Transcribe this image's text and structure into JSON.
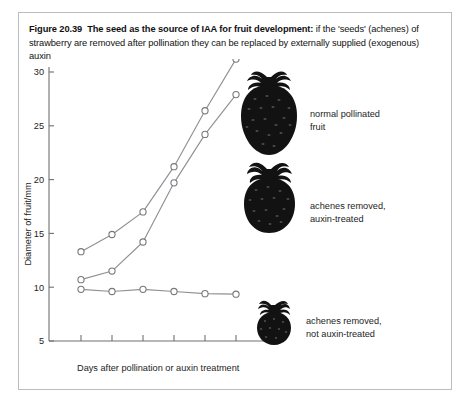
{
  "figure": {
    "number": "Figure 20.39",
    "title_bold": "The seed as the source of IAA for fruit development:",
    "title_rest": " if the 'seeds' (achenes) of strawberry are removed after pollination they can be replaced by externally supplied (exogenous) auxin"
  },
  "chart_data": {
    "type": "line",
    "title": "",
    "xlabel": "Days after pollination or auxin treatment",
    "ylabel": "Diameter of fruit/mm",
    "ylim": [
      5,
      30
    ],
    "yticks": [
      5,
      10,
      15,
      20,
      25,
      30
    ],
    "ytick_labels": [
      "5",
      "10",
      "15",
      "20",
      "25",
      "30"
    ],
    "xticks": [
      1,
      2,
      3,
      4,
      5,
      6
    ],
    "xtick_labels": [
      "",
      "",
      "",
      "",
      "",
      ""
    ],
    "x": [
      1,
      2,
      3,
      4,
      5,
      6
    ],
    "grid": false,
    "legend_position": "inline-annotations",
    "marker": "open-circle",
    "series": [
      {
        "name": "normal pollinated fruit",
        "values": [
          13.3,
          14.9,
          17.0,
          21.2,
          26.4,
          31.2
        ]
      },
      {
        "name": "achenes removed, auxin-treated",
        "values": [
          10.7,
          11.5,
          14.2,
          19.7,
          24.2,
          27.9
        ]
      },
      {
        "name": "achenes removed, not auxin-treated",
        "values": [
          9.8,
          9.6,
          9.8,
          9.6,
          9.4,
          9.35
        ]
      }
    ]
  },
  "annotations": [
    {
      "line1": "normal pollinated",
      "line2": "fruit",
      "icon": "strawberry-large-icon"
    },
    {
      "line1": "achenes removed,",
      "line2": "auxin-treated",
      "icon": "strawberry-medium-icon"
    },
    {
      "line1": "achenes removed,",
      "line2": "not auxin-treated",
      "icon": "strawberry-small-icon"
    }
  ],
  "colors": {
    "line": "#8e9194",
    "marker_stroke": "#76797c",
    "axis": "#6d7073",
    "text": "#1d1d1d",
    "berry": "#121212",
    "frame": "#b9bcc0"
  }
}
